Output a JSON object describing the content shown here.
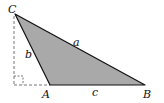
{
  "diagram": {
    "type": "triangle",
    "colors": {
      "fill": "#a9a9a9",
      "stroke": "#111111",
      "dashed": "#777777",
      "background": "#ffffff"
    },
    "vertices": {
      "A": {
        "label": "A",
        "x": 50,
        "y": 85
      },
      "B": {
        "label": "B",
        "x": 145,
        "y": 85
      },
      "C": {
        "label": "C",
        "x": 15,
        "y": 14
      }
    },
    "sides": {
      "a": {
        "label": "a",
        "between": "B-C"
      },
      "b": {
        "label": "b",
        "between": "A-C"
      },
      "c": {
        "label": "c",
        "between": "A-B"
      }
    },
    "altitude": {
      "style": "dashed",
      "right_angle_marker": true
    }
  }
}
